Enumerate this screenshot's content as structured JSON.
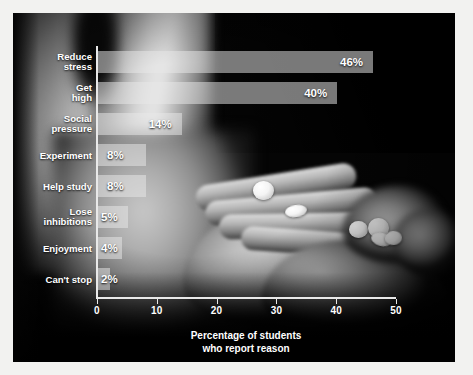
{
  "chart_data": {
    "type": "bar",
    "orientation": "horizontal",
    "title": "",
    "xlabel": "Percentage of students\nwho report reason",
    "xlabel_line1": "Percentage of students",
    "xlabel_line2": "who report reason",
    "ylabel": "",
    "categories": [
      "Reduce\nstress",
      "Get\nhigh",
      "Social\npressure",
      "Experiment",
      "Help study",
      "Lose\ninhibitions",
      "Enjoyment",
      "Can't stop"
    ],
    "values": [
      46,
      40,
      14,
      8,
      8,
      5,
      4,
      2
    ],
    "value_labels": [
      "46%",
      "40%",
      "14%",
      "8%",
      "8%",
      "5%",
      "4%",
      "2%"
    ],
    "xlim": [
      0,
      50
    ],
    "xticks": [
      0,
      10,
      20,
      30,
      40,
      50
    ],
    "xtick_labels": [
      "0",
      "10",
      "20",
      "30",
      "40",
      "50"
    ],
    "grid": false,
    "legend": false,
    "bar_color": "#e8e8e8",
    "text_color": "#ffffff",
    "axis_color": "#e9e9e9",
    "background": "photograph of an open hand holding white pills, grayscale"
  },
  "rows": [
    {
      "label_line1": "Reduce",
      "label_line2": "stress",
      "value": 46,
      "value_label": "46%"
    },
    {
      "label_line1": "Get",
      "label_line2": "high",
      "value": 40,
      "value_label": "40%"
    },
    {
      "label_line1": "Social",
      "label_line2": "pressure",
      "value": 14,
      "value_label": "14%"
    },
    {
      "label_line1": "Experiment",
      "label_line2": "",
      "value": 8,
      "value_label": "8%"
    },
    {
      "label_line1": "Help study",
      "label_line2": "",
      "value": 8,
      "value_label": "8%"
    },
    {
      "label_line1": "Lose",
      "label_line2": "inhibitions",
      "value": 5,
      "value_label": "5%"
    },
    {
      "label_line1": "Enjoyment",
      "label_line2": "",
      "value": 4,
      "value_label": "4%"
    },
    {
      "label_line1": "Can't stop",
      "label_line2": "",
      "value": 2,
      "value_label": "2%"
    }
  ],
  "axis": {
    "ticks": [
      "0",
      "10",
      "20",
      "30",
      "40",
      "50"
    ],
    "title_line1": "Percentage of students",
    "title_line2": "who report reason"
  }
}
